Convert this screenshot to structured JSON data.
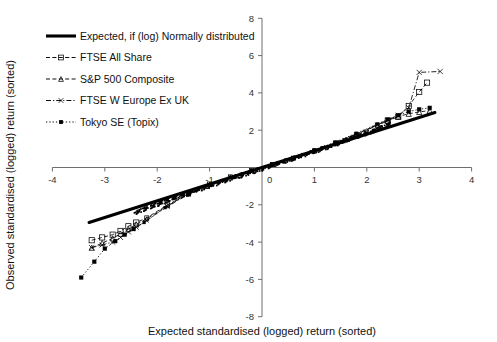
{
  "axes": {
    "xlabel": "Expected standardised (logged) return (sorted)",
    "ylabel": "Observed standardised (logged) return (sorted)",
    "xticks": [
      "-4",
      "-3",
      "-2",
      "-1",
      "0",
      "1",
      "2",
      "3",
      "4"
    ],
    "yticks": [
      "8",
      "6",
      "4",
      "2",
      "0",
      "-2",
      "-4",
      "-6",
      "-8"
    ]
  },
  "legend": {
    "items": [
      {
        "label": "Expected, if (log) Normally distributed",
        "marker": "solid-thick-line"
      },
      {
        "label": "FTSE All Share",
        "marker": "dashed-square"
      },
      {
        "label": "S&P 500 Composite",
        "marker": "dashed-triangle"
      },
      {
        "label": "FTSE W Europe Ex UK",
        "marker": "dashdot-cross"
      },
      {
        "label": "Tokyo SE (Topix)",
        "marker": "dotted-filled"
      }
    ]
  },
  "chart_data": {
    "type": "scatter",
    "title": "",
    "xlabel": "Expected standardised (logged) return (sorted)",
    "ylabel": "Observed standardised (logged) return (sorted)",
    "xlim": [
      -4,
      4
    ],
    "ylim": [
      -8,
      8
    ],
    "xticks": [
      -4,
      -3,
      -2,
      -1,
      0,
      1,
      2,
      3,
      4
    ],
    "yticks": [
      -8,
      -6,
      -4,
      -2,
      0,
      2,
      4,
      6,
      8
    ],
    "grid": false,
    "legend_position": "upper-left",
    "reference_line": {
      "name": "Expected, if (log) Normally distributed",
      "style": "solid-thick",
      "x": [
        -3.3,
        3.3
      ],
      "y": [
        -2.95,
        2.95
      ]
    },
    "series": [
      {
        "name": "FTSE All Share",
        "style": "dashed",
        "marker": "open-square",
        "x": [
          -3.25,
          -3.05,
          -2.85,
          -2.7,
          -2.55,
          -2.4,
          -2.2,
          -2.0,
          -1.8,
          -1.6,
          -1.4,
          -1.2,
          -1.0,
          -0.8,
          -0.6,
          -0.4,
          -0.2,
          0.0,
          0.2,
          0.4,
          0.6,
          0.8,
          1.0,
          1.2,
          1.4,
          1.6,
          1.8,
          2.0,
          2.2,
          2.4,
          2.6,
          2.8,
          3.0,
          3.15
        ],
        "y": [
          -3.9,
          -3.75,
          -3.6,
          -3.4,
          -3.15,
          -2.95,
          -2.7,
          -2.35,
          -2.0,
          -1.7,
          -1.4,
          -1.1,
          -0.88,
          -0.68,
          -0.5,
          -0.33,
          -0.16,
          0.0,
          0.16,
          0.33,
          0.5,
          0.68,
          0.88,
          1.08,
          1.3,
          1.52,
          1.76,
          2.0,
          2.26,
          2.5,
          2.72,
          3.3,
          4.05,
          4.55
        ]
      },
      {
        "name": "S&P 500 Composite",
        "style": "dashed",
        "marker": "open-triangle",
        "x": [
          -3.25,
          -3.05,
          -2.85,
          -2.7,
          -2.55,
          -2.4,
          -2.2,
          -2.0,
          -1.8,
          -1.6,
          -1.4,
          -1.2,
          -1.0,
          -0.8,
          -0.6,
          -0.4,
          -0.2,
          0.0,
          0.2,
          0.4,
          0.6,
          0.8,
          1.0,
          1.2,
          1.4,
          1.6,
          1.8,
          2.0,
          2.2,
          2.4,
          2.6,
          2.8,
          3.0,
          3.2
        ],
        "y": [
          -4.3,
          -4.05,
          -3.8,
          -3.55,
          -3.3,
          -3.05,
          -2.75,
          -2.4,
          -2.05,
          -1.72,
          -1.42,
          -1.15,
          -0.9,
          -0.7,
          -0.51,
          -0.34,
          -0.17,
          0.0,
          0.17,
          0.34,
          0.51,
          0.7,
          0.9,
          1.1,
          1.32,
          1.55,
          1.78,
          2.02,
          2.28,
          2.52,
          2.74,
          2.88,
          2.98,
          3.05
        ]
      },
      {
        "name": "FTSE W Europe Ex UK",
        "style": "dash-dot",
        "marker": "cross",
        "x": [
          -3.25,
          -3.05,
          -2.85,
          -2.7,
          -2.55,
          -2.4,
          -2.2,
          -2.0,
          -1.8,
          -1.6,
          -1.4,
          -1.2,
          -1.0,
          -0.8,
          -0.6,
          -0.4,
          -0.2,
          0.0,
          0.2,
          0.4,
          0.6,
          0.8,
          1.0,
          1.2,
          1.4,
          1.6,
          1.8,
          2.0,
          2.2,
          2.4,
          2.6,
          2.8,
          3.0,
          3.4
        ],
        "y": [
          -4.3,
          -4.15,
          -4.0,
          -3.75,
          -3.45,
          -3.2,
          -2.85,
          -2.45,
          -2.1,
          -1.75,
          -1.45,
          -1.17,
          -0.92,
          -0.71,
          -0.52,
          -0.34,
          -0.17,
          0.0,
          0.17,
          0.34,
          0.52,
          0.71,
          0.92,
          1.12,
          1.34,
          1.57,
          1.8,
          2.05,
          2.3,
          2.55,
          2.8,
          3.2,
          5.1,
          5.15
        ]
      },
      {
        "name": "Tokyo SE (Topix)",
        "style": "dotted",
        "marker": "filled-box",
        "x": [
          -3.45,
          -3.2,
          -3.0,
          -2.8,
          -2.62,
          -2.45,
          -2.25,
          -2.05,
          -1.85,
          -1.65,
          -1.42,
          -1.2,
          -1.0,
          -0.8,
          -0.6,
          -0.4,
          -0.2,
          0.0,
          0.2,
          0.4,
          0.6,
          0.8,
          1.0,
          1.2,
          1.4,
          1.6,
          1.8,
          2.0,
          2.2,
          2.4,
          2.6,
          2.8,
          3.0,
          3.2
        ],
        "y": [
          -5.9,
          -5.05,
          -4.35,
          -3.95,
          -3.6,
          -3.3,
          -2.95,
          -2.55,
          -2.15,
          -1.8,
          -1.48,
          -1.2,
          -0.95,
          -0.73,
          -0.53,
          -0.35,
          -0.17,
          0.0,
          0.17,
          0.35,
          0.53,
          0.73,
          0.95,
          1.15,
          1.37,
          1.6,
          1.84,
          2.08,
          2.34,
          2.58,
          2.8,
          3.0,
          3.12,
          3.2
        ]
      }
    ]
  }
}
